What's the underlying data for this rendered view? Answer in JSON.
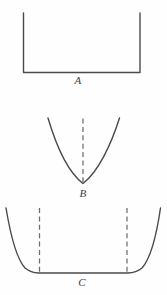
{
  "figure": {
    "background_color": "#fefefe",
    "stroke_color": "#4a4a4a",
    "guide_color": "#6d6d6d",
    "width": 167,
    "height": 295
  },
  "panels": [
    {
      "id": "A",
      "label": "A",
      "shape_name": "square-well-potential",
      "description": "Infinite square well: two vertical walls joined by a flat horizontal base",
      "curve_path": "M 23.5,13 L 23.5,72.5 L 140,72.5 L 140,13",
      "guide_lines": [],
      "label_position": {
        "x": 78,
        "y": 80
      }
    },
    {
      "id": "B",
      "label": "B",
      "shape_name": "parabolic-harmonic-potential",
      "description": "Harmonic oscillator parabola with dashed vertical axis of symmetry",
      "curve_path": "M 48,118 C 56,145 68,172 83,183.5 C 98,172 111,145 119.5,118",
      "guide_lines": [
        {
          "name": "center-axis",
          "x1": 83,
          "y1": 118.5,
          "x2": 83,
          "y2": 184
        }
      ],
      "label_position": {
        "x": 83,
        "y": 193
      }
    },
    {
      "id": "C",
      "label": "C",
      "shape_name": "flat-bottom-steep-wall-potential",
      "description": "Flat-bottomed well with steep exponential side walls and two dashed boundary lines",
      "curve_path": "M 6,208 C 10,232 16,258 25,268 C 30,272 34,272.8 38.5,273 L 128,273 C 132.5,272.8 137,272 142,268 C 151,258 157,232 160.5,208",
      "guide_lines": [
        {
          "name": "left-boundary",
          "x1": 39.5,
          "y1": 208,
          "x2": 39.5,
          "y2": 273
        },
        {
          "name": "right-boundary",
          "x1": 127,
          "y1": 208,
          "x2": 127,
          "y2": 273
        }
      ],
      "label_position": {
        "x": 82,
        "y": 282
      }
    }
  ]
}
